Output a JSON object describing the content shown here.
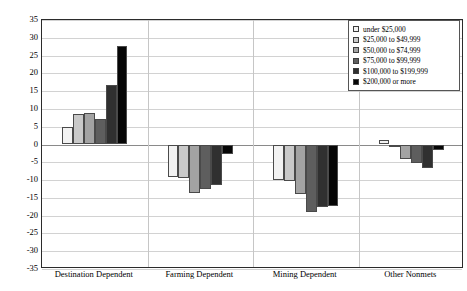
{
  "chart_data": {
    "type": "bar",
    "title": "",
    "subtitle": "",
    "xlabel": "",
    "ylabel": "",
    "ylim": [
      -35,
      35
    ],
    "ytick_step": 5,
    "yticks": [
      35,
      30,
      25,
      20,
      15,
      10,
      5,
      0,
      -5,
      -10,
      -15,
      -20,
      -25,
      -30,
      -35
    ],
    "ytick_labels": [
      "35",
      "30",
      "25",
      "20",
      "15",
      "10",
      "5",
      "0",
      "-5",
      "-10",
      "-15",
      "-20",
      "-25",
      "-30",
      "-35"
    ],
    "grid": true,
    "legend_position": "top-right",
    "categories": [
      "Destination Dependent",
      "Farming Dependent",
      "Mining Dependent",
      "Other Nonmets"
    ],
    "series": [
      {
        "name": "under $25,000",
        "color": "#f2f2f2",
        "values": [
          5.0,
          -9.0,
          -10.0,
          1.3
        ]
      },
      {
        "name": "$25,000 to $49,999",
        "color": "#c9c9c9",
        "values": [
          8.7,
          -9.3,
          -10.3,
          -0.3
        ]
      },
      {
        "name": "$50,000 to $74,999",
        "color": "#a3a3a3",
        "values": [
          8.8,
          -13.5,
          -14.0,
          -4.0
        ]
      },
      {
        "name": "$75,000 to $99,999",
        "color": "#5e5e5e",
        "values": [
          7.2,
          -12.5,
          -19.0,
          -5.2
        ]
      },
      {
        "name": "$100,000 to $199,999",
        "color": "#303030",
        "values": [
          16.8,
          -11.5,
          -17.5,
          -6.6
        ]
      },
      {
        "name": "$200,000 or more",
        "color": "#060606",
        "values": [
          27.7,
          -2.8,
          -17.3,
          -1.6
        ]
      }
    ]
  },
  "legend": {
    "items": [
      "under $25,000",
      "$25,000 to $49,999",
      "$50,000 to $74,999",
      "$75,000 to $99,999",
      "$100,000 to $199,999",
      "$200,000 or more"
    ]
  }
}
